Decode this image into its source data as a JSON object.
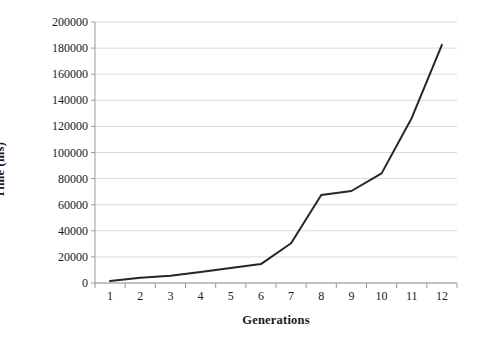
{
  "chart_data": {
    "type": "line",
    "title": "",
    "xlabel": "Generations",
    "ylabel": "Time (ms)",
    "categories": [
      "1",
      "2",
      "3",
      "4",
      "5",
      "6",
      "7",
      "8",
      "9",
      "10",
      "11",
      "12"
    ],
    "values": [
      1500,
      4000,
      5500,
      8500,
      11500,
      14500,
      30500,
      67500,
      70500,
      84000,
      126500,
      182500
    ],
    "series": [
      {
        "name": "Time",
        "values": [
          1500,
          4000,
          5500,
          8500,
          11500,
          14500,
          30500,
          67500,
          70500,
          84000,
          126500,
          182500
        ]
      }
    ],
    "ylim": [
      0,
      200000
    ],
    "y_ticks": [
      0,
      20000,
      40000,
      60000,
      80000,
      100000,
      120000,
      140000,
      160000,
      180000,
      200000
    ],
    "y_tick_labels": [
      "0",
      "20000",
      "40000",
      "60000",
      "80000",
      "100000",
      "120000",
      "140000",
      "160000",
      "180000",
      "200000"
    ],
    "x_tick_labels": [
      "1",
      "2",
      "3",
      "4",
      "5",
      "6",
      "7",
      "8",
      "9",
      "10",
      "11",
      "12"
    ],
    "grid": "horizontal",
    "legend": "none",
    "line_color": "#262626",
    "line_width": 2,
    "axis_color": "#9a9a9a",
    "gridline_color": "#d9d9d9",
    "background_color": "#ffffff",
    "markers": "none"
  },
  "axes": {
    "y_title": "Time (ms)",
    "x_title": "Generations"
  }
}
